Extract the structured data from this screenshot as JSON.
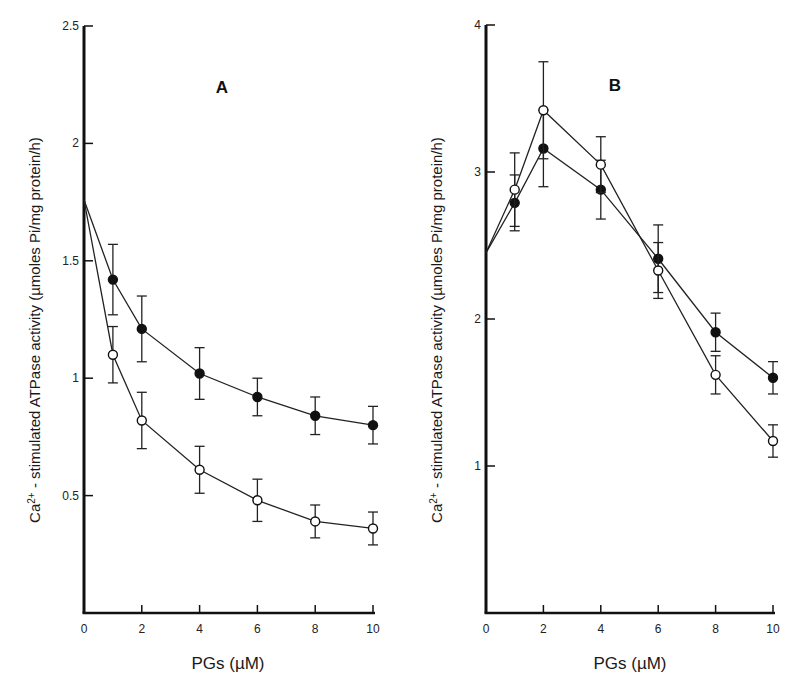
{
  "chart_data": [
    {
      "type": "line",
      "panel": "A",
      "title": "A",
      "xlabel": "PGs (µM)",
      "ylabel": "Ca2+ - stimulated ATPase activity (µmoles Pi/mg protein/h)",
      "xlim": [
        0,
        10
      ],
      "ylim": [
        0,
        2.5
      ],
      "xticks": [
        "0",
        "2",
        "4",
        "6",
        "8",
        "10"
      ],
      "yticks": [
        "0.5",
        "1",
        "1.5",
        "2",
        "2.5"
      ],
      "grid": false,
      "legend": "none",
      "x": [
        0,
        1,
        2,
        4,
        6,
        8,
        10
      ],
      "series": [
        {
          "name": "filled circles",
          "marker": "filled-circle",
          "values": [
            1.76,
            1.42,
            1.21,
            1.02,
            0.92,
            0.84,
            0.8
          ],
          "errors": [
            0,
            0.15,
            0.14,
            0.11,
            0.08,
            0.08,
            0.08
          ]
        },
        {
          "name": "open circles",
          "marker": "open-circle",
          "values": [
            1.76,
            1.1,
            0.82,
            0.61,
            0.48,
            0.39,
            0.36
          ],
          "errors": [
            0,
            0.12,
            0.12,
            0.1,
            0.09,
            0.07,
            0.07
          ]
        }
      ]
    },
    {
      "type": "line",
      "panel": "B",
      "title": "B",
      "xlabel": "PGs (µM)",
      "ylabel": "Ca2+ - stimulated ATPase activity (µmoles Pi/mg protein/h)",
      "xlim": [
        0,
        10
      ],
      "ylim": [
        0,
        4
      ],
      "xticks": [
        "0",
        "2",
        "4",
        "6",
        "8",
        "10"
      ],
      "yticks": [
        "1",
        "2",
        "3",
        "4"
      ],
      "grid": false,
      "legend": "none",
      "x": [
        0,
        1,
        2,
        4,
        6,
        8,
        10
      ],
      "series": [
        {
          "name": "filled circles",
          "marker": "filled-circle",
          "values": [
            2.45,
            2.79,
            3.16,
            2.88,
            2.41,
            1.91,
            1.6
          ],
          "errors": [
            0,
            0.19,
            0.26,
            0.2,
            0.23,
            0.13,
            0.11
          ]
        },
        {
          "name": "open circles",
          "marker": "open-circle",
          "values": [
            2.45,
            2.88,
            3.42,
            3.05,
            2.33,
            1.62,
            1.17
          ],
          "errors": [
            0,
            0.25,
            0.33,
            0.19,
            0.19,
            0.13,
            0.11
          ]
        }
      ]
    }
  ],
  "panels": {
    "A": {
      "letter": "A",
      "xlabel": "PGs (µM)"
    },
    "B": {
      "letter": "B",
      "xlabel": "PGs (µM)"
    }
  }
}
